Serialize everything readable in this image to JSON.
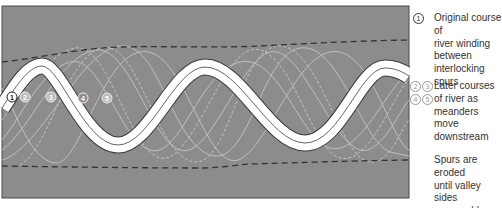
{
  "diagram": {
    "colors": {
      "panel": "#8c8c8c",
      "panel_border": "#4a4a4a",
      "river_fill": "#ffffff",
      "river_edge": "#3a3a3a",
      "later_course": "#c4c4c4",
      "valley_side_dashed": "#3a3a3a"
    },
    "course_markers": [
      {
        "label": "1",
        "x": 12,
        "y": 97,
        "style": "dark"
      },
      {
        "label": "2",
        "x": 25,
        "y": 97,
        "style": "light"
      },
      {
        "label": "3",
        "x": 51,
        "y": 97,
        "style": "light"
      },
      {
        "label": "4",
        "x": 83,
        "y": 98,
        "style": "light"
      },
      {
        "label": "5",
        "x": 107,
        "y": 98,
        "style": "light"
      }
    ]
  },
  "legend": {
    "original": {
      "marker": "1",
      "text": "Original course of\nriver winding\nbetween\ninterlocking spurs"
    },
    "later": {
      "markers_row1": [
        "2",
        "3"
      ],
      "markers_row2": [
        "4",
        "5"
      ],
      "text": "Later courses\nof river as\nmeanders move\ndownstream"
    },
    "spurs": {
      "text": "Spurs are eroded\nuntil valley sides\nare roughly\nparallel"
    }
  }
}
